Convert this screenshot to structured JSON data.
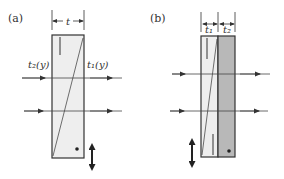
{
  "figure": {
    "panels": [
      {
        "id": "a",
        "label": "(a)",
        "dimension_label": "t",
        "left_label": "t₂(y)",
        "right_label": "t₁(y)",
        "description": "Single wedge-cut plate with diagonal interface; two horizontal rays pass through; vertical double arrow indicates translation"
      },
      {
        "id": "b",
        "label": "(b)",
        "dimension_labels": [
          "t₁",
          "t₂"
        ],
        "description": "Wedge plate (light) combined with a compensating plate (gray); two horizontal rays pass through; vertical double arrow indicates translation"
      }
    ],
    "colors": {
      "stroke": "#333333",
      "plate_light": "#eeeeee",
      "plate_gray": "#b8b8b8",
      "background": "#ffffff"
    }
  }
}
